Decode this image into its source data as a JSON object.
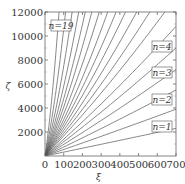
{
  "chart_data": {
    "type": "line",
    "title": "",
    "xlabel": "ξ",
    "ylabel": "ζ",
    "xlim": [
      0,
      700
    ],
    "ylim": [
      0,
      12000
    ],
    "x_ticks": [
      "0",
      "100",
      "200",
      "300",
      "400",
      "500",
      "600",
      "700"
    ],
    "y_ticks": [
      "2000",
      "4000",
      "6000",
      "8000",
      "10000",
      "12000"
    ],
    "grid": false,
    "legend": "inline labels",
    "annotations": [
      "n=19",
      "n=4",
      "n=3",
      "n=2",
      "n=1"
    ],
    "series_description": "Family of 19 curves from origin, n=1..19; lower n nearly straight lines, higher n steeper with slight upward curvature",
    "series": [
      {
        "name": "n=1",
        "x": [
          0,
          700
        ],
        "y": [
          0,
          2300
        ]
      },
      {
        "name": "n=2",
        "x": [
          0,
          700
        ],
        "y": [
          0,
          3900
        ]
      },
      {
        "name": "n=3",
        "x": [
          0,
          700
        ],
        "y": [
          0,
          5500
        ]
      },
      {
        "name": "n=4",
        "x": [
          0,
          700
        ],
        "y": [
          0,
          7200
        ]
      },
      {
        "name": "n=5",
        "x": [
          0,
          700
        ],
        "y": [
          0,
          9000
        ]
      },
      {
        "name": "n=6",
        "x": [
          0,
          700
        ],
        "y": [
          0,
          10800
        ]
      },
      {
        "name": "n=7",
        "x": [
          0,
          640
        ],
        "y": [
          0,
          12000
        ]
      },
      {
        "name": "n=8",
        "x": [
          0,
          560
        ],
        "y": [
          0,
          12000
        ]
      },
      {
        "name": "n=9",
        "x": [
          0,
          490
        ],
        "y": [
          0,
          12000
        ]
      },
      {
        "name": "n=10",
        "x": [
          0,
          430
        ],
        "y": [
          0,
          12000
        ]
      },
      {
        "name": "n=11",
        "x": [
          0,
          380
        ],
        "y": [
          0,
          12000
        ]
      },
      {
        "name": "n=12",
        "x": [
          0,
          335
        ],
        "y": [
          0,
          12000
        ]
      },
      {
        "name": "n=13",
        "x": [
          0,
          290
        ],
        "y": [
          0,
          12000
        ]
      },
      {
        "name": "n=14",
        "x": [
          0,
          250
        ],
        "y": [
          0,
          12000
        ]
      },
      {
        "name": "n=15",
        "x": [
          0,
          215
        ],
        "y": [
          0,
          12000
        ]
      },
      {
        "name": "n=16",
        "x": [
          0,
          180
        ],
        "y": [
          0,
          12000
        ]
      },
      {
        "name": "n=17",
        "x": [
          0,
          145
        ],
        "y": [
          0,
          12000
        ]
      },
      {
        "name": "n=18",
        "x": [
          0,
          110
        ],
        "y": [
          0,
          12000
        ]
      },
      {
        "name": "n=19",
        "x": [
          0,
          75
        ],
        "y": [
          0,
          12000
        ]
      }
    ]
  }
}
